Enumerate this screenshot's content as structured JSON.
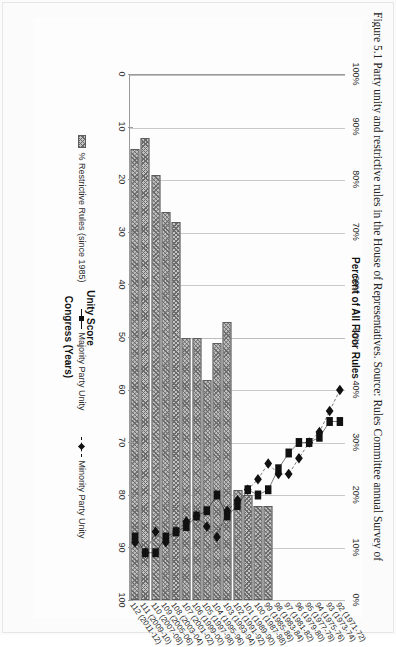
{
  "figure": {
    "caption": "Figure 5.1 Party unity and restrictive rules in the House of Representatives. Source: Rules Committee annual Survey of"
  },
  "chart_data": {
    "type": "bar",
    "title": "",
    "orientation": "horizontal-scan-rotated",
    "xlabel": "Congress (Years)",
    "ylabel": "Unity Score",
    "y2label": "Percent of All Floor Rules",
    "ylim": [
      0,
      100
    ],
    "y2lim": [
      0,
      100
    ],
    "grid": true,
    "legend_position": "bottom",
    "categories": [
      "92 (1971-72)",
      "93 (1973-74)",
      "94 (1975-76)",
      "95 (1977-78)",
      "96 (1979-80)",
      "97 (1981-82)",
      "98 (1983-84)",
      "99 (1985-86)",
      "100 (1987-88)",
      "101 (1989-90)",
      "102 (1991-92)",
      "103 (1993-94)",
      "104 (1995-96)",
      "105 (1997-98)",
      "106 (1999-00)",
      "107 (2001-02)",
      "108 (2003-04)",
      "109 (2005-06)",
      "110 (2007-08)",
      "111 (2009-10)",
      "112 (2011-12)"
    ],
    "yticks": [
      0,
      10,
      20,
      30,
      40,
      50,
      60,
      70,
      80,
      90,
      100
    ],
    "y2ticks": [
      "0%",
      "10%",
      "20%",
      "30%",
      "40%",
      "50%",
      "60%",
      "70%",
      "80%",
      "90%",
      "100%"
    ],
    "series": [
      {
        "name": "% Restrictive Rules (since 1985)",
        "kind": "bar",
        "axis": "secondary",
        "values": [
          null,
          null,
          null,
          null,
          null,
          null,
          null,
          18,
          18,
          20,
          21,
          53,
          49,
          42,
          50,
          50,
          72,
          74,
          81,
          88,
          86
        ]
      },
      {
        "name": "Majority Party Unity",
        "kind": "line",
        "axis": "primary",
        "marker": "square",
        "line": "solid",
        "values": [
          66,
          66,
          69,
          70,
          70,
          72,
          75,
          79,
          80,
          79,
          82,
          84,
          80,
          83,
          84,
          86,
          87,
          88,
          91,
          91,
          88
        ]
      },
      {
        "name": "Minority Party Unity",
        "kind": "line",
        "axis": "primary",
        "marker": "diamond",
        "line": "dashed",
        "values": [
          60,
          64,
          68,
          70,
          73,
          76,
          76,
          74,
          77,
          79,
          81,
          83,
          88,
          86,
          84,
          85,
          87,
          89,
          87,
          91,
          89
        ]
      }
    ],
    "colors": {
      "bar_fill": "#c2c2c2",
      "bar_hatch": "#6b6b6b",
      "line_majority": "#111111",
      "line_minority": "#111111",
      "gridline": "#c9c9c9",
      "axis": "#9a9a9a"
    }
  }
}
